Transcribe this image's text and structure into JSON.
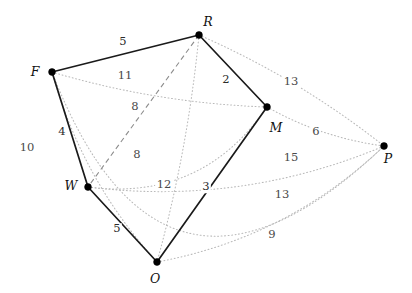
{
  "figure": {
    "type": "weighted-graph",
    "width": 412,
    "height": 293,
    "background": "#ffffff",
    "solid_edge_color": "#1a1a1a",
    "dashed_edge_color": "#8c8c8c",
    "dotted_edge_color": "#b9b9b9",
    "vertex_color": "#000000"
  },
  "vertices": [
    {
      "id": "F",
      "label": "F",
      "x": 52,
      "y": 72,
      "label_x": 35,
      "label_y": 72
    },
    {
      "id": "R",
      "label": "R",
      "x": 199,
      "y": 35,
      "label_x": 208,
      "label_y": 22
    },
    {
      "id": "M",
      "label": "M",
      "x": 267,
      "y": 107,
      "label_x": 276,
      "label_y": 128
    },
    {
      "id": "P",
      "label": "P",
      "x": 384,
      "y": 146,
      "label_x": 388,
      "label_y": 159
    },
    {
      "id": "O",
      "label": "O",
      "x": 157,
      "y": 262,
      "label_x": 155,
      "label_y": 279
    },
    {
      "id": "W",
      "label": "W",
      "x": 88,
      "y": 187,
      "label_x": 71,
      "label_y": 186
    }
  ],
  "edges": [
    {
      "from": "F",
      "to": "R",
      "weight": "5",
      "style": "solid",
      "label_x": 123,
      "label_y": 42,
      "curve": 0
    },
    {
      "from": "R",
      "to": "M",
      "weight": "2",
      "style": "solid",
      "label_x": 226,
      "label_y": 80,
      "curve": 0
    },
    {
      "from": "M",
      "to": "O",
      "weight": "3",
      "style": "solid",
      "label_x": 206,
      "label_y": 187,
      "curve": 0
    },
    {
      "from": "O",
      "to": "W",
      "weight": "5",
      "style": "solid",
      "label_x": 117,
      "label_y": 229,
      "curve": 0
    },
    {
      "from": "W",
      "to": "F",
      "weight": "4",
      "style": "solid",
      "label_x": 62,
      "label_y": 132,
      "curve": 0
    },
    {
      "from": "R",
      "to": "W",
      "weight": "8",
      "style": "dashed",
      "label_x": 135,
      "label_y": 107,
      "curve": 0
    },
    {
      "from": "F",
      "to": "M",
      "weight": "11",
      "style": "dotted",
      "label_x": 125,
      "label_y": 76,
      "curve": 14
    },
    {
      "from": "F",
      "to": "O",
      "weight": "8",
      "style": "dotted",
      "label_x": 137,
      "label_y": 155,
      "curve": 26
    },
    {
      "from": "F",
      "to": "P",
      "weight": "10",
      "style": "dotted",
      "label_x": 27,
      "label_y": 148,
      "curve": 255
    },
    {
      "from": "R",
      "to": "P",
      "weight": "13",
      "style": "dotted",
      "label_x": 291,
      "label_y": 82,
      "curve": -14
    },
    {
      "from": "R",
      "to": "O",
      "weight": "12",
      "style": "dotted",
      "label_x": 164,
      "label_y": 185,
      "curve": -10
    },
    {
      "from": "M",
      "to": "P",
      "weight": "6",
      "style": "dotted",
      "label_x": 316,
      "label_y": 132,
      "curve": 12
    },
    {
      "from": "M",
      "to": "W",
      "weight": "15",
      "style": "dotted",
      "label_x": 291,
      "label_y": 158,
      "curve": -60
    },
    {
      "from": "W",
      "to": "P",
      "weight": "13",
      "style": "dotted",
      "label_x": 282,
      "label_y": 195,
      "curve": 40
    },
    {
      "from": "O",
      "to": "P",
      "weight": "9",
      "style": "dotted",
      "label_x": 272,
      "label_y": 235,
      "curve": 38
    }
  ]
}
